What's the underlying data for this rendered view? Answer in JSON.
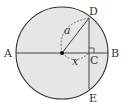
{
  "diagram": {
    "type": "circle-geometry",
    "colors": {
      "fill": "#e6e6e6",
      "stroke": "#333333",
      "text": "#333333"
    },
    "circle": {
      "cx": 62,
      "cy": 53,
      "r": 46
    },
    "points": {
      "A": {
        "label": "A",
        "x": 16,
        "y": 53
      },
      "B": {
        "label": "B",
        "x": 108,
        "y": 53
      },
      "C": {
        "label": "C",
        "x": 89,
        "y": 53
      },
      "D": {
        "label": "D",
        "x": 89,
        "y": 18
      },
      "E": {
        "label": "E",
        "x": 89,
        "y": 89
      },
      "O": {
        "label": "",
        "x": 62,
        "y": 53
      }
    },
    "measures": {
      "radius_label": "a",
      "distance_label": "x"
    },
    "segments": [
      "AB",
      "DE",
      "OD"
    ],
    "annotations": [
      "right-angle at C",
      "dashed arc O–D labeled a",
      "dashed arc O–C labeled x"
    ]
  }
}
